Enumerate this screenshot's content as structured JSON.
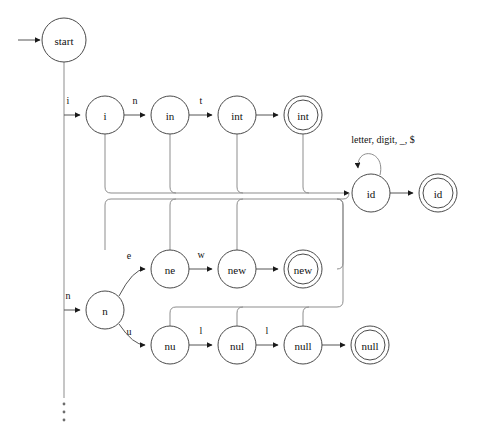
{
  "figure": {
    "kind": "transition-diagram",
    "background_color": "#ffffff",
    "stroke_color": "#4a4a4a",
    "faint_stroke_color": "#8d8d8d",
    "text_color": "#111111",
    "width": 479,
    "height": 439
  },
  "start": {
    "label": "start",
    "arrow_name": "start-arrow"
  },
  "states": [
    {
      "id": "start",
      "label": "start",
      "cx": 64,
      "cy": 40,
      "r": 22,
      "accepting": false
    },
    {
      "id": "i",
      "label": "i",
      "cx": 105,
      "cy": 115,
      "r": 19,
      "accepting": false
    },
    {
      "id": "in",
      "label": "in",
      "cx": 170,
      "cy": 115,
      "r": 19,
      "accepting": false
    },
    {
      "id": "int",
      "label": "int",
      "cx": 237,
      "cy": 115,
      "r": 19,
      "accepting": false
    },
    {
      "id": "int-accept",
      "label": "int",
      "cx": 303,
      "cy": 115,
      "r": 19,
      "accepting": true
    },
    {
      "id": "id",
      "label": "id",
      "cx": 371,
      "cy": 193,
      "r": 19,
      "accepting": false
    },
    {
      "id": "id-accept",
      "label": "id",
      "cx": 438,
      "cy": 193,
      "r": 19,
      "accepting": true
    },
    {
      "id": "ne",
      "label": "ne",
      "cx": 170,
      "cy": 269,
      "r": 19,
      "accepting": false
    },
    {
      "id": "new",
      "label": "new",
      "cx": 237,
      "cy": 269,
      "r": 19,
      "accepting": false
    },
    {
      "id": "new-accept",
      "label": "new",
      "cx": 303,
      "cy": 269,
      "r": 19,
      "accepting": true
    },
    {
      "id": "n",
      "label": "n",
      "cx": 105,
      "cy": 310,
      "r": 19,
      "accepting": false
    },
    {
      "id": "nu",
      "label": "nu",
      "cx": 170,
      "cy": 345,
      "r": 19,
      "accepting": false
    },
    {
      "id": "nul",
      "label": "nul",
      "cx": 237,
      "cy": 345,
      "r": 19,
      "accepting": false
    },
    {
      "id": "null",
      "label": "null",
      "cx": 303,
      "cy": 345,
      "r": 19,
      "accepting": false
    },
    {
      "id": "null-accept",
      "label": "null",
      "cx": 370,
      "cy": 345,
      "r": 19,
      "accepting": true
    }
  ],
  "edge_labels": {
    "start_to_i": "i",
    "i_to_in": "n",
    "in_to_int": "t",
    "start_to_n": "n",
    "n_to_ne": "e",
    "ne_to_new": "w",
    "n_to_nu": "u",
    "nu_to_nul": "l",
    "nul_to_null": "l",
    "id_self_loop": "letter, digit, _, $"
  },
  "transitions": [
    {
      "from": "start",
      "to": "i",
      "label": "i"
    },
    {
      "from": "i",
      "to": "in",
      "label": "n"
    },
    {
      "from": "in",
      "to": "int",
      "label": "t"
    },
    {
      "from": "int",
      "to": "int-accept",
      "label": ""
    },
    {
      "from": "start",
      "to": "n",
      "label": "n"
    },
    {
      "from": "n",
      "to": "ne",
      "label": "e"
    },
    {
      "from": "ne",
      "to": "new",
      "label": "w"
    },
    {
      "from": "new",
      "to": "new-accept",
      "label": ""
    },
    {
      "from": "n",
      "to": "nu",
      "label": "u"
    },
    {
      "from": "nu",
      "to": "nul",
      "label": "l"
    },
    {
      "from": "nul",
      "to": "null",
      "label": "l"
    },
    {
      "from": "null",
      "to": "null-accept",
      "label": ""
    },
    {
      "from": "id",
      "to": "id-accept",
      "label": ""
    },
    {
      "from": "id",
      "to": "id",
      "label": "letter, digit, _, $"
    },
    {
      "from": "i",
      "to": "id",
      "label": ""
    },
    {
      "from": "in",
      "to": "id",
      "label": ""
    },
    {
      "from": "int",
      "to": "id",
      "label": ""
    },
    {
      "from": "ne",
      "to": "id",
      "label": ""
    },
    {
      "from": "new",
      "to": "id",
      "label": ""
    },
    {
      "from": "new-accept",
      "to": "id",
      "label": ""
    },
    {
      "from": "nu",
      "to": "id",
      "label": ""
    },
    {
      "from": "nul",
      "to": "id",
      "label": ""
    },
    {
      "from": "null",
      "to": "id",
      "label": ""
    }
  ],
  "ellipsis": {
    "name": "vertical-ellipsis",
    "glyph": "⋮",
    "x": 64,
    "y": 412
  }
}
